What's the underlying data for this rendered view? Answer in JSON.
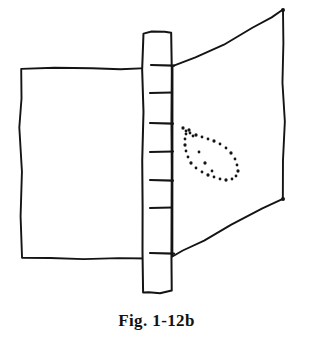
{
  "figure": {
    "caption": "Fig. 1-12b",
    "medium": "hand-drawn ink line sketch",
    "background_color": "#ffffff",
    "ink_color": "#141414",
    "canvas": {
      "width": 313,
      "height": 340
    },
    "drawing_area": {
      "x": 0,
      "y": 0,
      "width": 313,
      "height": 302
    }
  },
  "parts": {
    "left_panel": {
      "name": "left flat rectangular panel",
      "stroke_color": "#141414",
      "stroke_width": 1.9,
      "fill": "none",
      "bounds": {
        "x": 20,
        "y": 68,
        "width": 127,
        "height": 190
      },
      "outline_points": "21,69 54,68 92,68 120,69 147,68 147,110 146,150 147,196 147,235 147,258 118,258 84,259 50,258 22,258 21,216 22,172 20,128 21,98"
    },
    "center_post": {
      "name": "vertical slotted post",
      "stroke_color": "#141414",
      "stroke_width": 2.0,
      "fill": "none",
      "bounds": {
        "x": 142,
        "y": 31,
        "width": 30,
        "height": 262
      },
      "outline_points": "144,33 152,31 165,32 171,33 172,72 171,120 172,168 171,214 172,258 172,291 160,293 149,292 143,292 142,252 143,206 142,160 143,112 142,70",
      "tick_count": 7,
      "ticks": [
        {
          "index": 1,
          "y": 65,
          "x1": 151,
          "x2": 174
        },
        {
          "index": 2,
          "y": 93,
          "x1": 150,
          "x2": 172
        },
        {
          "index": 3,
          "y": 123,
          "x1": 150,
          "x2": 173
        },
        {
          "index": 4,
          "y": 152,
          "x1": 150,
          "x2": 173
        },
        {
          "index": 5,
          "y": 180,
          "x1": 150,
          "x2": 173
        },
        {
          "index": 6,
          "y": 208,
          "x1": 150,
          "x2": 172
        },
        {
          "index": 7,
          "y": 253,
          "x1": 150,
          "x2": 174
        }
      ]
    },
    "right_panel": {
      "name": "right panel drawn in perspective (trapezoid)",
      "stroke_color": "#141414",
      "stroke_width": 1.9,
      "fill": "none",
      "corners": {
        "top_left": {
          "x": 172,
          "y": 66
        },
        "top_right": {
          "x": 283,
          "y": 10
        },
        "bottom_right": {
          "x": 283,
          "y": 199
        },
        "bottom_left": {
          "x": 172,
          "y": 256
        }
      },
      "outline_points": "172,66 196,58 224,44 252,28 272,17 283,10 284,44 283,82 285,122 283,160 283,199 262,208 232,224 204,240 182,251 172,256"
    },
    "dotted_marking": {
      "name": "dotted teardrop contour marking",
      "dot_color": "#141414",
      "dot_radius": 1.4,
      "tip": {
        "x": 183,
        "y": 128
      },
      "wide_end": {
        "x": 238,
        "y": 178
      },
      "dots": [
        [
          183,
          128
        ],
        [
          186,
          131
        ],
        [
          190,
          133
        ],
        [
          196,
          135
        ],
        [
          202,
          137
        ],
        [
          208,
          139
        ],
        [
          214,
          141
        ],
        [
          220,
          144
        ],
        [
          226,
          148
        ],
        [
          231,
          153
        ],
        [
          235,
          159
        ],
        [
          237,
          165
        ],
        [
          238,
          171
        ],
        [
          236,
          176
        ],
        [
          232,
          179
        ],
        [
          226,
          180
        ],
        [
          220,
          179
        ],
        [
          214,
          177
        ],
        [
          208,
          175
        ],
        [
          202,
          172
        ],
        [
          196,
          168
        ],
        [
          191,
          163
        ],
        [
          188,
          157
        ],
        [
          186,
          151
        ],
        [
          185,
          145
        ],
        [
          185,
          139
        ],
        [
          186,
          134
        ],
        [
          189,
          130
        ],
        [
          193,
          136
        ],
        [
          199,
          152
        ],
        [
          205,
          163
        ],
        [
          212,
          171
        ]
      ]
    }
  }
}
